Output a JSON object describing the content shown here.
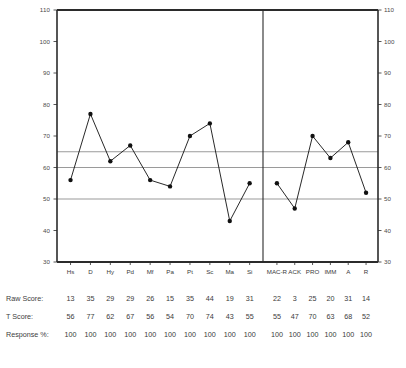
{
  "chart_data": {
    "type": "line",
    "title": "",
    "xlabel": "",
    "ylabel": "",
    "ylim": [
      30,
      110
    ],
    "yticks": [
      30,
      40,
      50,
      60,
      70,
      80,
      90,
      100,
      110
    ],
    "ytick_labels": [
      "30",
      "40",
      "50",
      "60",
      "70",
      "80",
      "90",
      "100",
      "110"
    ],
    "right_axis_ticks": [
      30,
      40,
      50,
      60,
      70,
      80,
      90,
      100,
      110
    ],
    "right_axis_tick_labels": [
      "30",
      "40",
      "50",
      "60",
      "70",
      "80",
      "90",
      "100",
      "110"
    ],
    "grid": false,
    "legend": "none",
    "reference_lines": [
      {
        "value": 65,
        "color": "#9a9a9a"
      },
      {
        "value": 60,
        "color": "#9a9a9a"
      },
      {
        "value": 50,
        "color": "#9a9a9a"
      }
    ],
    "panel_divider_after_index": 9,
    "categories": [
      "Hs",
      "D",
      "Hy",
      "Pd",
      "Mf",
      "Pa",
      "Pt",
      "Sc",
      "Ma",
      "Si",
      "MAC-R",
      "ACK",
      "PRO",
      "IMM",
      "A",
      "R"
    ],
    "series": [
      {
        "name": "T Score",
        "values": [
          56,
          77,
          62,
          67,
          56,
          54,
          70,
          74,
          43,
          55,
          55,
          47,
          70,
          63,
          68,
          52
        ],
        "color": "#111111",
        "marker": "circle"
      }
    ]
  },
  "table": {
    "row_labels": [
      "Raw Score:",
      "T Score:",
      "Response %:"
    ],
    "rows": [
      {
        "label": "Raw Score:",
        "clinical": [
          "13",
          "35",
          "29",
          "29",
          "26",
          "15",
          "35",
          "44",
          "19",
          "31"
        ],
        "supplementary": [
          "22",
          "3",
          "25",
          "20",
          "31",
          "14"
        ]
      },
      {
        "label": "T Score:",
        "clinical": [
          "56",
          "77",
          "62",
          "67",
          "56",
          "54",
          "70",
          "74",
          "43",
          "55"
        ],
        "supplementary": [
          "55",
          "47",
          "70",
          "63",
          "68",
          "52"
        ]
      },
      {
        "label": "Response %:",
        "clinical": [
          "100",
          "100",
          "100",
          "100",
          "100",
          "100",
          "100",
          "100",
          "100",
          "100"
        ],
        "supplementary": [
          "100",
          "100",
          "100",
          "100",
          "100",
          "100"
        ]
      }
    ]
  },
  "axis": {
    "left_ticks": [
      "110",
      "100",
      "90",
      "80",
      "70",
      "60",
      "50",
      "40",
      "30"
    ],
    "right_ticks": [
      "110",
      "100",
      "90",
      "80",
      "70",
      "60",
      "50",
      "40",
      "30"
    ]
  },
  "scales": {
    "clinical": [
      "Hs",
      "D",
      "Hy",
      "Pd",
      "Mf",
      "Pa",
      "Pt",
      "Sc",
      "Ma",
      "Si"
    ],
    "supplementary": [
      "MAC-R",
      "ACK",
      "PRO",
      "IMM",
      "A",
      "R"
    ]
  },
  "colors": {
    "line": "#111111",
    "axis": "#2b2b2b",
    "reference": "#9a9a9a",
    "text": "#3a3a3a"
  },
  "footer": {
    "note": ""
  }
}
